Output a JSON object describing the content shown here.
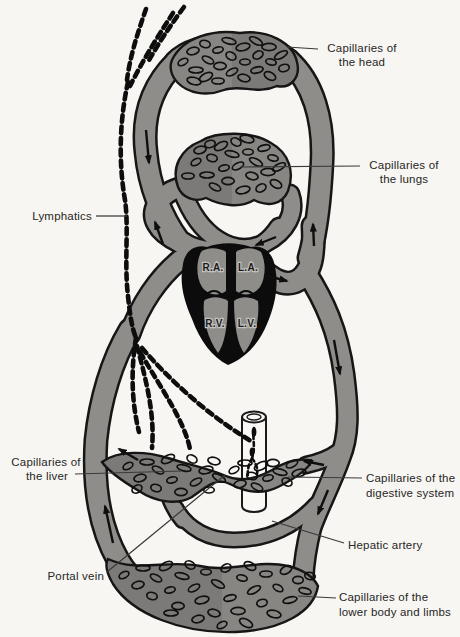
{
  "diagram": {
    "type": "circulatory-system-schematic",
    "labels": {
      "head": {
        "line1": "Capillaries of",
        "line2": "the head"
      },
      "lungs": {
        "line1": "Capillaries of",
        "line2": "the lungs"
      },
      "lymphatics": "Lymphatics",
      "liver": {
        "line1": "Capillaries of",
        "line2": "the liver"
      },
      "digestive": {
        "line1": "Capillaries of the",
        "line2": "digestive system"
      },
      "hepatic_artery": "Hepatic artery",
      "portal_vein": "Portal vein",
      "lower_body": {
        "line1": "Capillaries of the",
        "line2": "lower body and limbs"
      }
    },
    "heart": {
      "ra": "R.A.",
      "la": "L.A.",
      "rv": "R.V.",
      "lv": "L.V."
    },
    "colors": {
      "background": "#f8f6f2",
      "vessel_gray": "#8e8d8a",
      "capillary_bed_gray": "#878683",
      "outline_black": "#161616",
      "text": "#262626"
    }
  }
}
